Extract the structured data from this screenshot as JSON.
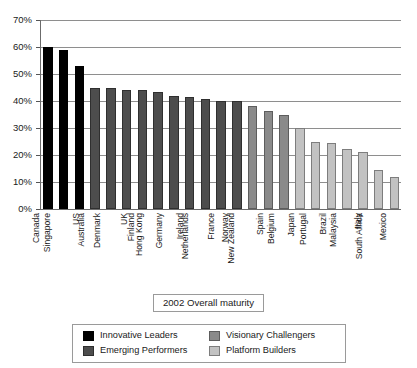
{
  "chart_data": {
    "type": "bar",
    "title": "",
    "xlabel": "2002 Overall maturity",
    "ylabel": "",
    "ylim": [
      0,
      70
    ],
    "y_unit": "%",
    "grid": true,
    "legend_position": "bottom",
    "y_ticks": [
      "0%",
      "10%",
      "20%",
      "30%",
      "40%",
      "50%",
      "60%",
      "70%"
    ],
    "y_tick_values": [
      0,
      10,
      20,
      30,
      40,
      50,
      60,
      70
    ],
    "categories": [
      "Canada",
      "Singapore",
      "US",
      "Australia",
      "Denmark",
      "UK",
      "Finland",
      "Hong Kong",
      "Germany",
      "Ireland",
      "Netherlands",
      "France",
      "Norway",
      "New Zealand",
      "Spain",
      "Belgium",
      "Japan",
      "Portugal",
      "Brazil",
      "Malaysia",
      "Italy",
      "South Africa",
      "Mexico"
    ],
    "values": [
      60.0,
      59.0,
      53.0,
      45.0,
      45.0,
      44.2,
      44.2,
      43.5,
      42.0,
      41.5,
      40.7,
      40.0,
      40.0,
      38.3,
      36.2,
      34.7,
      30.0,
      25.0,
      24.5,
      22.3,
      21.0,
      14.5,
      11.7
    ],
    "group_index": [
      0,
      0,
      0,
      1,
      1,
      1,
      1,
      1,
      1,
      1,
      1,
      1,
      1,
      2,
      2,
      2,
      3,
      3,
      3,
      3,
      3,
      3,
      3
    ],
    "groups": [
      {
        "name": "Innovative Leaders",
        "color": "#000000"
      },
      {
        "name": "Emerging Performers",
        "color": "#4d4d4d"
      },
      {
        "name": "Visionary Challengers",
        "color": "#8a8a8a"
      },
      {
        "name": "Platform Builders",
        "color": "#c2c2c2"
      }
    ]
  },
  "legend": {
    "items": [
      {
        "label": "Innovative Leaders",
        "group": 0
      },
      {
        "label": "Visionary Challengers",
        "group": 2
      },
      {
        "label": "Emerging Performers",
        "group": 1
      },
      {
        "label": "Platform Builders",
        "group": 3
      }
    ]
  }
}
